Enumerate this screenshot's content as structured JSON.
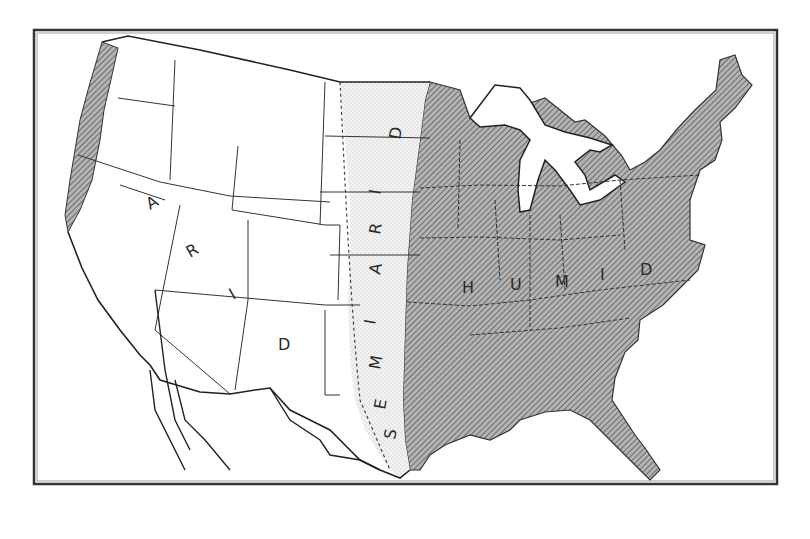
{
  "map": {
    "title": "",
    "regions": [
      {
        "name": "ARID",
        "letters": [
          "A",
          "R",
          "I",
          "D"
        ],
        "fill": "#ffffff"
      },
      {
        "name": "SEMIARID",
        "letters": [
          "S",
          "E",
          "M",
          "I",
          "A",
          "R",
          "I",
          "D"
        ],
        "fill": "#ececec"
      },
      {
        "name": "HUMID",
        "letters": [
          "H",
          "U",
          "M",
          "I",
          "D"
        ],
        "fill": "#9a9a9a"
      }
    ],
    "colors": {
      "frame": "#333333",
      "border": "#333333",
      "humid_fill": "#9a9a9a",
      "semiarid_fill": "#ececec",
      "arid_fill": "#ffffff",
      "water": "#ffffff"
    }
  }
}
